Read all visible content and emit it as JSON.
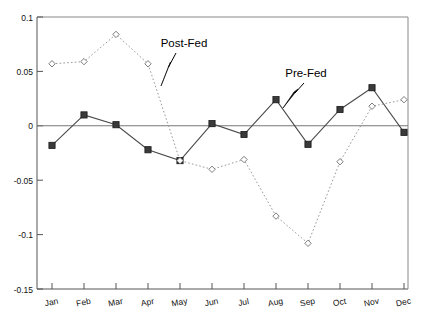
{
  "chart_data": {
    "type": "line",
    "title": "",
    "subtitle": "",
    "xlabel": "",
    "ylabel": "",
    "categories": [
      "Jan",
      "Feb",
      "Mar",
      "Apr",
      "May",
      "Jun",
      "Jul",
      "Aug",
      "Sep",
      "Oct",
      "Nov",
      "Dec"
    ],
    "series": [
      {
        "name": "Pre-Fed",
        "marker": "filled-square",
        "linestyle": "solid",
        "color": "#3a3a3a",
        "values": [
          -0.018,
          0.01,
          0.001,
          -0.022,
          -0.032,
          0.002,
          -0.008,
          0.024,
          -0.017,
          0.015,
          0.035,
          -0.006
        ]
      },
      {
        "name": "Post-Fed",
        "marker": "open-diamond",
        "linestyle": "dotted",
        "color": "#999999",
        "values": [
          0.057,
          0.059,
          0.084,
          0.057,
          -0.032,
          -0.04,
          -0.031,
          -0.083,
          -0.108,
          -0.033,
          0.018,
          0.024
        ]
      }
    ],
    "ylim": [
      -0.15,
      0.1
    ],
    "yticks": [
      0.1,
      0.05,
      0,
      -0.05,
      -0.1,
      -0.15
    ],
    "ytick_labels": [
      "0.1",
      "0.05",
      "0",
      "-0.05",
      "-0.1",
      "-0.15"
    ],
    "grid": false,
    "legend_position": "inline-annotations",
    "annotations": [
      {
        "text": "Post-Fed",
        "points_to_series": "Post-Fed",
        "near_category": "Apr"
      },
      {
        "text": "Pre-Fed",
        "points_to_series": "Pre-Fed",
        "near_category": "Aug"
      }
    ]
  },
  "axes": {
    "y_labels": {
      "t0": "0.1",
      "t1": "0.05",
      "t2": "0",
      "t3": "-0.05",
      "t4": "-0.1",
      "t5": "-0.15"
    },
    "x_labels": {
      "m0": "Jan",
      "m1": "Feb",
      "m2": "Mar",
      "m3": "Apr",
      "m4": "May",
      "m5": "Jun",
      "m6": "Jul",
      "m7": "Aug",
      "m8": "Sep",
      "m9": "Oct",
      "m10": "Nov",
      "m11": "Dec"
    }
  },
  "annotations": {
    "post_fed": "Post-Fed",
    "pre_fed": "Pre-Fed"
  },
  "colors": {
    "pre_fed": "#3a3a3a",
    "post_fed": "#999999",
    "axis": "#555555",
    "background": "#ffffff"
  }
}
